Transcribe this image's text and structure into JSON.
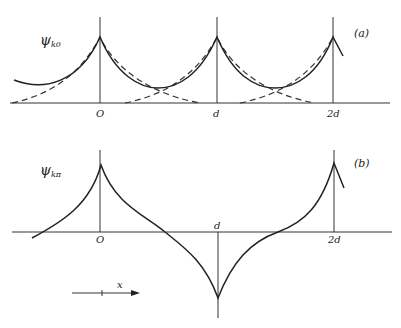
{
  "panel_a": {
    "ylabel": "ψ",
    "ylabel_sub": "k0",
    "panel_label": "(a)",
    "ticks": [
      "O",
      "d",
      "2d"
    ]
  },
  "panel_b": {
    "ylabel": "ψ",
    "ylabel_sub": "kπ",
    "panel_label": "(b)",
    "ticks": [
      "O",
      "d",
      "2d"
    ]
  },
  "x_arrow_label": "x"
}
